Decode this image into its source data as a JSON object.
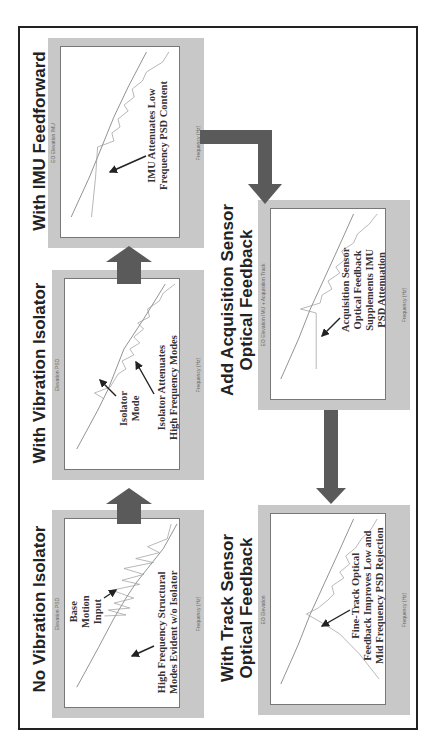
{
  "diagram": {
    "orientation": "rotated 90 degrees counter-clockwise",
    "colors": {
      "frame": "#222222",
      "panel_bg": "#c8c8c8",
      "flow_arrow": "#5a5a5a",
      "plot_line": "#555555"
    },
    "stages": [
      {
        "title": "No Vibration Isolator",
        "plot_title": "Elevation PSD",
        "y_label": "PSD (urad²/Hz)",
        "x_label": "Frequency (Hz)",
        "annotations": [
          {
            "text": "Base Motion Input"
          },
          {
            "text": "High Frequency Structural Modes Evident w/o Isolator"
          }
        ]
      },
      {
        "title": "With Vibration Isolator",
        "plot_title": "Elevation PSD",
        "y_label": "PSD (urad²/Hz)",
        "x_label": "Frequency (Hz)",
        "annotations": [
          {
            "text": "Isolator Mode"
          },
          {
            "text": "Isolator Attenuates High Frequency Modes"
          }
        ]
      },
      {
        "title": "With IMU Feedforward",
        "plot_title": "EO Elevation IMU",
        "y_label": "PSD (urad²/Hz)",
        "x_label": "Frequency (Hz)",
        "annotations": [
          {
            "text": "IMU Attenuates Low Frequency PSD Content"
          }
        ]
      },
      {
        "title": "Add Acquisition Sensor Optical Feedback",
        "plot_title": "EO Elevation IMU + Acquisition Track",
        "y_label": "PSD (urad²/Hz)",
        "x_label": "Frequency (Hz)",
        "annotations": [
          {
            "text": "Acquisition Sensor Optical Feedback Supplements IMU PSD Attenuation"
          }
        ]
      },
      {
        "title": "With Track Sensor Optical Feedback",
        "plot_title": "EO Elevation",
        "y_label": "PSD (urad²/Hz)",
        "x_label": "Frequency (Hz)",
        "annotations": [
          {
            "text": "Fine-Track Optical Feedback Improves Low and Mid Frequency PSD Rejection"
          }
        ]
      }
    ],
    "labels": {
      "s1_title": "No Vibration Isolator",
      "s2_title": "With Vibration Isolator",
      "s3_title": "With IMU Feedforward",
      "s4_title_l1": "Add Acquisition Sensor",
      "s4_title_l2": "Optical Feedback",
      "s5_title_l1": "With Track Sensor",
      "s5_title_l2": "Optical Feedback",
      "s1_plot": "Elevation PSD",
      "s2_plot": "Elevation PSD",
      "s3_plot": "EO Elevation IMU",
      "s4_plot": "EO Elevation IMU + Acquisition Track",
      "s5_plot": "EO Elevation",
      "ylab": "PSD (urad²/Hz)",
      "xlab": "Frequency (Hz)",
      "s1_a1_l1": "Base",
      "s1_a1_l2": "Motion",
      "s1_a1_l3": "Input",
      "s1_a2_l1": "High Frequency Structural",
      "s1_a2_l2": "Modes Evident w/o Isolator",
      "s2_a1_l1": "Isolator",
      "s2_a1_l2": "Mode",
      "s2_a2_l1": "Isolator Attenuates",
      "s2_a2_l2": "High Frequency Modes",
      "s3_a1_l1": "IMU Attenuates Low",
      "s3_a1_l2": "Frequency PSD Content",
      "s4_a1_l1": "Acquisition Sensor",
      "s4_a1_l2": "Optical Feedback",
      "s4_a1_l3": "Supplements IMU",
      "s4_a1_l4": "PSD Attenuation",
      "s5_a1_l1": "Fine-Track Optical",
      "s5_a1_l2": "Feedback Improves Low and",
      "s5_a1_l3": "Mid Frequency PSD Rejection",
      "ytick": [
        "10⁸",
        "10⁶",
        "10⁴",
        "10²",
        "10⁰",
        "10⁻²",
        "10⁻⁴",
        "10⁻⁶"
      ],
      "xtick": [
        "10⁻²",
        "10⁻¹",
        "10⁰",
        "10¹",
        "10²",
        "10³",
        "10⁴"
      ]
    },
    "flow": [
      {
        "from": "No Vibration Isolator",
        "to": "With Vibration Isolator"
      },
      {
        "from": "With Vibration Isolator",
        "to": "With IMU Feedforward"
      },
      {
        "from": "With IMU Feedforward",
        "to": "Add Acquisition Sensor Optical Feedback"
      },
      {
        "from": "Add Acquisition Sensor Optical Feedback",
        "to": "With Track Sensor Optical Feedback"
      }
    ]
  }
}
